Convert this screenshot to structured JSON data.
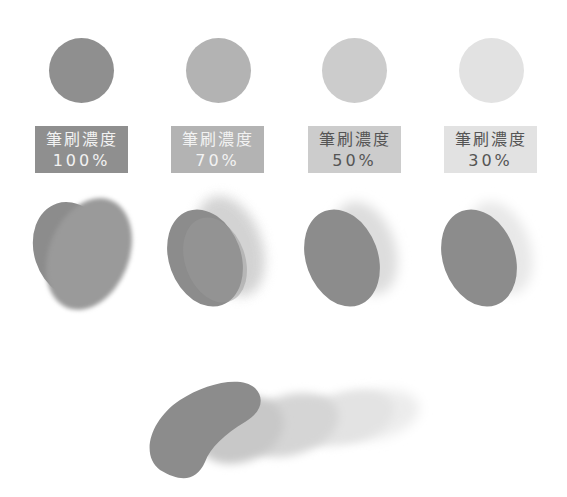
{
  "swatches": [
    {
      "label": "筆刷濃度",
      "value": "100%",
      "circle_color": "#8f8f8f",
      "box_color": "#8f8f8f",
      "text_color": "#f2f2f2"
    },
    {
      "label": "筆刷濃度",
      "value": "70%",
      "circle_color": "#b3b3b3",
      "box_color": "#b3b3b3",
      "text_color": "#f2f2f2"
    },
    {
      "label": "筆刷濃度",
      "value": "50%",
      "circle_color": "#cccccc",
      "box_color": "#cccccc",
      "text_color": "#555555"
    },
    {
      "label": "筆刷濃度",
      "value": "30%",
      "circle_color": "#e2e2e2",
      "box_color": "#e2e2e2",
      "text_color": "#555555"
    }
  ]
}
